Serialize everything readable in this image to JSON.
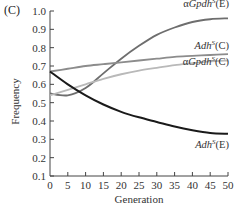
{
  "panel_label": "(C)",
  "chart_data": {
    "type": "line",
    "title": "",
    "xlabel": "Generation",
    "ylabel": "Frequency",
    "xlim": [
      0,
      50
    ],
    "ylim": [
      0.1,
      1.0
    ],
    "xticks": [
      0,
      5,
      10,
      15,
      20,
      25,
      30,
      35,
      40,
      45,
      50
    ],
    "yticks": [
      0.1,
      0.2,
      0.3,
      0.4,
      0.5,
      0.6,
      0.7,
      0.8,
      0.9,
      1.0
    ],
    "xtick_labels": [
      "0",
      "5",
      "10",
      "15",
      "20",
      "25",
      "30",
      "35",
      "40",
      "45",
      "50"
    ],
    "ytick_labels": [
      "0.1",
      "0.2",
      "0.3",
      "0.4",
      "0.5",
      "0.6",
      "0.7",
      "0.8",
      "0.9",
      "1.0"
    ],
    "grid": false,
    "legend": "inline labels at right end of lines",
    "x": [
      0,
      5,
      10,
      15,
      20,
      25,
      30,
      35,
      40,
      45,
      50
    ],
    "series": [
      {
        "name": "αGpdh^S(E)",
        "label_prefix": "α",
        "label_italic": "Gpdh",
        "label_sup": "S",
        "label_suffix": "(E)",
        "color": "#6e6e6e",
        "values": [
          0.55,
          0.54,
          0.58,
          0.66,
          0.74,
          0.81,
          0.87,
          0.91,
          0.94,
          0.955,
          0.96
        ]
      },
      {
        "name": "Adh^S(C)",
        "label_prefix": "",
        "label_italic": "Adh",
        "label_sup": "S",
        "label_suffix": "(C)",
        "color": "#8c8c8c",
        "values": [
          0.67,
          0.685,
          0.7,
          0.71,
          0.72,
          0.73,
          0.74,
          0.75,
          0.755,
          0.76,
          0.765
        ]
      },
      {
        "name": "αGpdh^S(C)",
        "label_prefix": "α",
        "label_italic": "Gpdh",
        "label_sup": "S",
        "label_suffix": "(C)",
        "color": "#b9b9b9",
        "values": [
          0.54,
          0.57,
          0.6,
          0.63,
          0.655,
          0.675,
          0.69,
          0.705,
          0.715,
          0.725,
          0.73
        ]
      },
      {
        "name": "Adh^S(E)",
        "label_prefix": "",
        "label_italic": "Adh",
        "label_sup": "S",
        "label_suffix": "(E)",
        "color": "#1a1a1a",
        "values": [
          0.67,
          0.6,
          0.54,
          0.49,
          0.45,
          0.42,
          0.395,
          0.37,
          0.35,
          0.335,
          0.33
        ]
      }
    ]
  }
}
